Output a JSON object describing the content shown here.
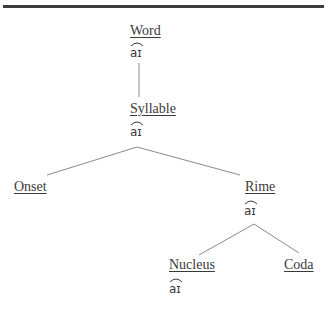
{
  "diagram": {
    "type": "syllable-structure-tree",
    "nodes": {
      "word": {
        "label": "Word",
        "ipa": "aɪ"
      },
      "syllable": {
        "label": "Syllable",
        "ipa": "aɪ"
      },
      "onset": {
        "label": "Onset"
      },
      "rime": {
        "label": "Rime",
        "ipa": "aɪ"
      },
      "nucleus": {
        "label": "Nucleus",
        "ipa": "aɪ"
      },
      "coda": {
        "label": "Coda"
      }
    },
    "edges": [
      [
        "Word",
        "Syllable"
      ],
      [
        "Syllable",
        "Onset"
      ],
      [
        "Syllable",
        "Rime"
      ],
      [
        "Rime",
        "Nucleus"
      ],
      [
        "Rime",
        "Coda"
      ]
    ],
    "colors": {
      "text": "#3a3a3a",
      "lines": "#8a8a8a",
      "rule": "#3c3c3c"
    }
  }
}
